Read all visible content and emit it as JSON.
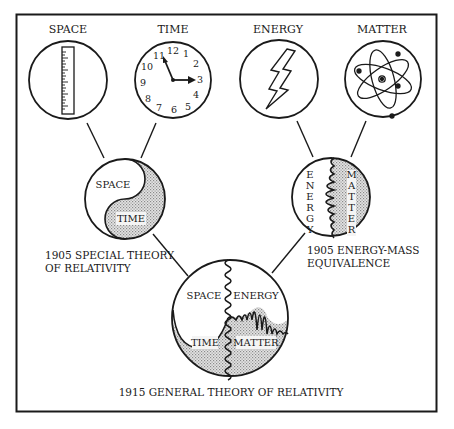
{
  "diagram": {
    "concepts": [
      {
        "id": "space",
        "label": "SPACE",
        "icon": "ruler-icon"
      },
      {
        "id": "time",
        "label": "TIME",
        "icon": "clock-icon"
      },
      {
        "id": "energy",
        "label": "ENERGY",
        "icon": "lightning-bolt-icon"
      },
      {
        "id": "matter",
        "label": "MATTER",
        "icon": "atom-icon"
      }
    ],
    "clock": {
      "numbers": [
        "12",
        "1",
        "2",
        "3",
        "4",
        "5",
        "6",
        "7",
        "8",
        "9",
        "10",
        "11"
      ],
      "hour_hand_points_to": "3",
      "minute_hand_points_to": "11"
    },
    "special_relativity": {
      "top_label": "SPACE",
      "bottom_label": "TIME",
      "caption_line1": "1905 SPECIAL THEORY",
      "caption_line2": "OF RELATIVITY"
    },
    "energy_mass": {
      "left_label_letters": [
        "E",
        "N",
        "E",
        "R",
        "G",
        "Y"
      ],
      "right_label_letters": [
        "M",
        "A",
        "T",
        "T",
        "E",
        "R"
      ],
      "caption_line1": "1905 ENERGY-MASS",
      "caption_line2": "EQUIVALENCE"
    },
    "general_relativity": {
      "top_left": "SPACE",
      "top_right": "ENERGY",
      "bottom_left": "TIME",
      "bottom_right": "MATTER",
      "caption": "1915 GENERAL THEORY OF RELATIVITY"
    },
    "colors": {
      "ink": "#1a1a1a",
      "shade": "#d4d4d4",
      "background": "#ffffff"
    }
  }
}
